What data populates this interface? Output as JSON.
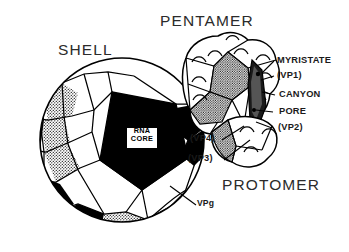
{
  "figure": {
    "background_color": "#ffffff",
    "ink_color": "#000000"
  },
  "titles": {
    "shell": "SHELL",
    "pentamer": "PENTAMER",
    "protomer": "PROTOMER"
  },
  "core_label": {
    "line1": "RNA",
    "line2": "CORE"
  },
  "callouts": {
    "myristate": "MYRISTATE",
    "vp1": "(VP1)",
    "canyon": "CANYON",
    "pore": "PORE",
    "vp2": "(VP2)",
    "vp4": "(VP4)",
    "vp3": "(VP3)",
    "vpg": "VPg"
  },
  "shading": {
    "white_facet": "#ffffff",
    "stipple_facet": "#9a9a9a",
    "black_facet": "#000000",
    "interior_shadow": "#000000"
  }
}
